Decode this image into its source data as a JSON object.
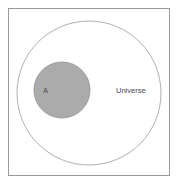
{
  "diagram": {
    "type": "venn-diagram",
    "background_color": "#ffffff",
    "frame": {
      "name": "diagram-border",
      "stroke_color": "#9a9a9a",
      "fill_color": "#ffffff"
    },
    "universe": {
      "label": "Universe",
      "shape": "circle",
      "fill_color": "#ffffff",
      "stroke_color": "#b0b0b0",
      "label_x": 131,
      "label_y": 93
    },
    "set_a": {
      "label": "A",
      "shape": "circle",
      "fill_color": "#ababab",
      "stroke_color": "#9d9d9d",
      "label_x": 43,
      "label_y": 93
    }
  }
}
